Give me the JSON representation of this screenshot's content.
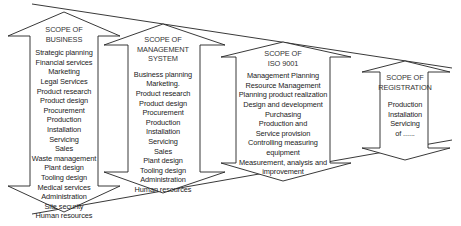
{
  "diagram": {
    "colors": {
      "line": "#222222",
      "text": "#222222",
      "background": "#ffffff"
    },
    "funnel": {
      "top_line": {
        "x1": 32,
        "y1": 4,
        "x2": 452,
        "y2": 68
      },
      "bottom_line": {
        "x1": 32,
        "y1": 214,
        "x2": 452,
        "y2": 140
      }
    },
    "scopes": [
      {
        "id": "business",
        "title_lines": [
          "SCOPE OF",
          "BUSINESS"
        ],
        "items": [
          "Strategic planning",
          "Financial services",
          "Marketing",
          "Legal Services",
          "Product research",
          "Product design",
          "Procurement",
          "Production",
          "Installation",
          "Servicing",
          "Sales",
          "Waste management",
          "Plant design",
          "Tooling design",
          "Medical services",
          "Administration",
          "Site security",
          "Human resources"
        ]
      },
      {
        "id": "management-system",
        "title_lines": [
          "SCOPE OF",
          "MANAGEMENT",
          "SYSTEM"
        ],
        "items": [
          "Business planning",
          "Marketing.",
          "Product research",
          "Product design",
          "Procurement",
          "Production",
          "Installation",
          "Servicing",
          "Sales",
          "Plant design",
          "Tooling design",
          "Administration",
          "Human resources"
        ]
      },
      {
        "id": "iso-9001",
        "title_lines": [
          "SCOPE OF",
          "ISO 9001"
        ],
        "items": [
          "Management Planning",
          "Resource Management",
          "Planning product realization",
          "Design and development",
          "Purchasing",
          "Production and",
          "Service  provision",
          "Controlling measuring",
          "equipment",
          "Measurement, analysis and",
          "improvement"
        ]
      },
      {
        "id": "registration",
        "title_lines": [
          "SCOPE OF",
          "REGISTRATION"
        ],
        "items": [
          "Production",
          "Installation",
          "Servicing",
          "of ......"
        ]
      }
    ]
  }
}
